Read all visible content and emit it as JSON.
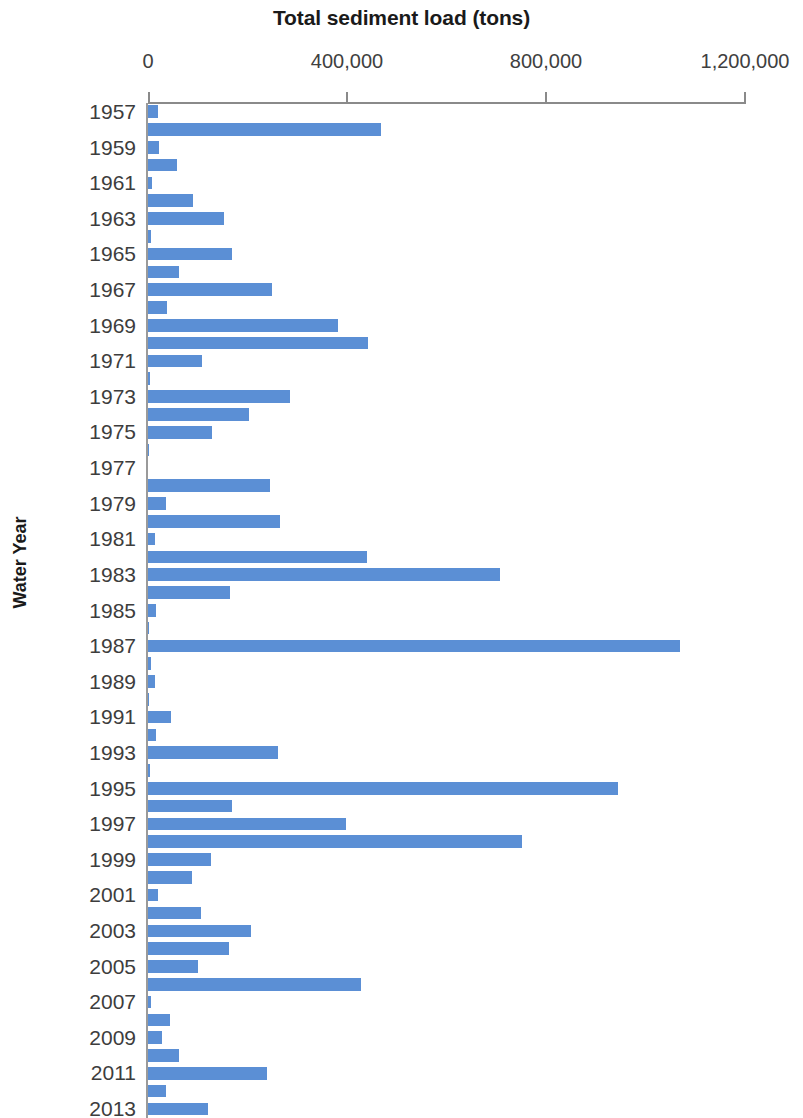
{
  "chart_data": {
    "type": "bar",
    "orientation": "horizontal",
    "title": "Total sediment load (tons)",
    "xlabel": "Total sediment load (tons)",
    "ylabel": "Water Year",
    "xlim": [
      0,
      1200000
    ],
    "ylim_categories": [
      "1957",
      "2013"
    ],
    "xticks": [
      0,
      400000,
      800000,
      1200000
    ],
    "xtick_labels": [
      "0",
      "400,000",
      "800,000",
      "1,200,000"
    ],
    "ytick_labels": [
      "1957",
      "1959",
      "1961",
      "1963",
      "1965",
      "1967",
      "1969",
      "1971",
      "1973",
      "1975",
      "1977",
      "1979",
      "1981",
      "1983",
      "1985",
      "1987",
      "1989",
      "1991",
      "1993",
      "1995",
      "1997",
      "1999",
      "2001",
      "2003",
      "2005",
      "2007",
      "2009",
      "2011",
      "2013"
    ],
    "ytick_interval": 2,
    "grid": false,
    "legend": null,
    "bar_color": "#5B8FD5",
    "axis_color": "#8a8a8a",
    "text_color": "#3d3d3d",
    "categories": [
      "1957",
      "1958",
      "1959",
      "1960",
      "1961",
      "1962",
      "1963",
      "1964",
      "1965",
      "1966",
      "1967",
      "1968",
      "1969",
      "1970",
      "1971",
      "1972",
      "1973",
      "1974",
      "1975",
      "1976",
      "1977",
      "1978",
      "1979",
      "1980",
      "1981",
      "1982",
      "1983",
      "1984",
      "1985",
      "1986",
      "1987",
      "1988",
      "1989",
      "1990",
      "1991",
      "1992",
      "1993",
      "1994",
      "1995",
      "1996",
      "1997",
      "1998",
      "1999",
      "2000",
      "2001",
      "2002",
      "2003",
      "2004",
      "2005",
      "2006",
      "2007",
      "2008",
      "2009",
      "2010",
      "2011",
      "2012",
      "2013"
    ],
    "values": [
      20000,
      468000,
      22000,
      58000,
      8000,
      90000,
      152000,
      6000,
      168000,
      62000,
      250000,
      38000,
      382000,
      442000,
      108000,
      4000,
      286000,
      204000,
      128000,
      2000,
      0,
      246000,
      36000,
      266000,
      14000,
      440000,
      708000,
      164000,
      16000,
      2000,
      1070000,
      6000,
      14000,
      2000,
      46000,
      16000,
      262000,
      4000,
      944000,
      168000,
      398000,
      752000,
      126000,
      88000,
      20000,
      106000,
      208000,
      162000,
      100000,
      428000,
      6000,
      44000,
      28000,
      62000,
      240000,
      36000,
      120000
    ]
  },
  "axis": {
    "y_title": "Water Year"
  }
}
